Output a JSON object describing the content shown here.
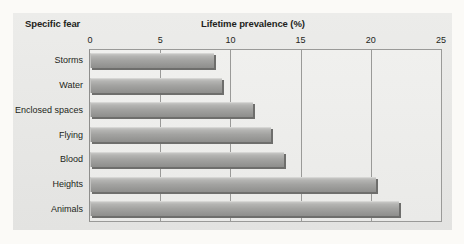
{
  "chart_data": {
    "type": "bar",
    "orientation": "horizontal",
    "title": "",
    "xlabel": "Lifetime prevalence (%)",
    "ylabel": "Specific fear",
    "categories": [
      "Storms",
      "Water",
      "Enclosed spaces",
      "Flying",
      "Blood",
      "Heights",
      "Animals"
    ],
    "values": [
      8.8,
      9.4,
      11.6,
      12.9,
      13.8,
      20.4,
      22.0
    ],
    "series": [
      {
        "name": "Lifetime prevalence (%)",
        "values": [
          8.8,
          9.4,
          11.6,
          12.9,
          13.8,
          20.4,
          22.0
        ]
      }
    ],
    "xlim": [
      0,
      25
    ],
    "xticks": [
      0,
      5,
      10,
      15,
      20,
      25
    ],
    "xtick_labels": [
      "0",
      "5",
      "10",
      "15",
      "20",
      "25"
    ],
    "grid": "vertical",
    "legend": "none",
    "bar_color": "#a3a3a1",
    "bar_edge_color": "#6e6e6c",
    "panel_color": "#e9e9e7",
    "plot_color": "#eeeeec",
    "axis_color": "#9a9a98",
    "text_color": "#231f20"
  }
}
